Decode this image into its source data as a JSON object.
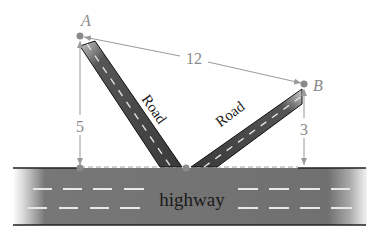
{
  "diagram": {
    "points": {
      "A": {
        "label": "A"
      },
      "B": {
        "label": "B"
      }
    },
    "dimensions": {
      "distance_AB": "12",
      "height_A": "5",
      "height_B": "3"
    },
    "roads": {
      "left_label": "Road",
      "right_label": "Road"
    },
    "highway": {
      "label": "highway"
    },
    "colors": {
      "dimension_gray": "#9a9a9a",
      "point_gray": "#8a8a8a",
      "road_dark": "#3c3c3c",
      "highway_gray": "#6e6e6e",
      "lane_marking": "#e8e8e8"
    }
  }
}
